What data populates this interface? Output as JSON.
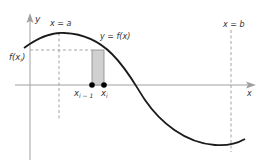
{
  "diagram": {
    "type": "riemann-rectangle",
    "labels": {
      "y_axis": "y",
      "x_axis": "x",
      "x_eq_a": "x = a",
      "x_eq_b": "x = b",
      "curve": "y = f(x)",
      "f_xi_base": "f(x",
      "f_xi_sub": "i",
      "f_xi_close": ")",
      "x_im1_base": "x",
      "x_im1_sub": "i − 1",
      "x_i_base": "x",
      "x_i_sub": "i"
    },
    "colors": {
      "axis": "#999999",
      "curve": "#1a1a1a",
      "dashed": "#888888",
      "rect_fill": "#cccccc",
      "rect_stroke": "#888888",
      "point": "#000000",
      "text": "#333333"
    }
  }
}
